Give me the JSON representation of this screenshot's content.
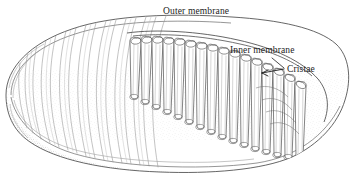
{
  "figure": {
    "style": "pen-and-ink line drawing, cut-away view",
    "background_color": "#ffffff",
    "ink_color": "#333333",
    "line_color": "#555555",
    "stipple_color": "#777777",
    "width": 357,
    "height": 186
  },
  "labels": {
    "outer_membrane": "Outer membrane",
    "inner_membrane": "Inner membrane",
    "cristae": "Cristae"
  },
  "annotations": [
    {
      "name": "outer-membrane",
      "text": "Outer membrane",
      "x": 163,
      "y": 7,
      "leader": "none"
    },
    {
      "name": "inner-membrane",
      "text": "Inner membrane",
      "x": 230,
      "y": 46,
      "leader": "none"
    },
    {
      "name": "cristae",
      "text": "Cristae",
      "x": 287,
      "y": 65,
      "leader": "arrow pointing left toward cristae folds"
    }
  ],
  "structures": [
    {
      "name": "outer-membrane",
      "description": "smooth elongated ovoid envelope enclosing the organelle"
    },
    {
      "name": "inner-membrane",
      "description": "membrane folded inward to form the cristae"
    },
    {
      "name": "cristae",
      "description": "transverse shelf-like infoldings of the inner membrane"
    },
    {
      "name": "matrix",
      "description": "stippled interior space between cristae"
    }
  ]
}
